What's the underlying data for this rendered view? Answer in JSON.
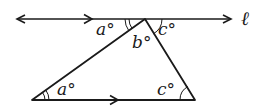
{
  "diagram": {
    "line_label": "ℓ",
    "labels": {
      "top_left_angle": "a°",
      "top_middle_angle": "b°",
      "top_right_angle": "c°",
      "bottom_left_angle": "a°",
      "bottom_right_angle": "c°"
    },
    "colors": {
      "stroke": "#1a1a1a",
      "background": "#ffffff"
    }
  }
}
